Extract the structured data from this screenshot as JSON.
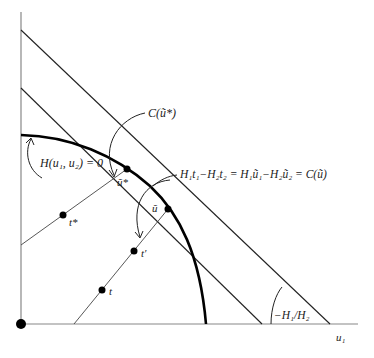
{
  "diagram": {
    "type": "economics-frontier",
    "axes": {
      "x_label": "u₁",
      "origin_marker": "dot"
    },
    "curves": [
      {
        "id": "frontier",
        "label": "H(u₁, u₂) = 0",
        "style": "thick"
      }
    ],
    "lines": [
      {
        "id": "upper-tangent",
        "label": "C(ũ*)"
      },
      {
        "id": "middle-tangent",
        "label": "H₁t₁−H₂t₂ = H₁ũ₁−H₂ũ₂ = C(ũ)"
      },
      {
        "id": "ray-tstar",
        "label": ""
      },
      {
        "id": "ray-t",
        "label": ""
      }
    ],
    "points": [
      {
        "id": "u-tilde-star",
        "label": "ũ*"
      },
      {
        "id": "u-tilde",
        "label": "ũ"
      },
      {
        "id": "t-star",
        "label": "t*"
      },
      {
        "id": "t-prime",
        "label": "t′"
      },
      {
        "id": "t",
        "label": "t"
      }
    ],
    "angle_label": "−H₁/H₂"
  },
  "labels": {
    "c_ustar": "C(ũ*)",
    "h_curve": "H(u₁, u₂) = 0",
    "equation": "H₁t₁−H₂t₂ = H₁ũ₁−H₂ũ₂ = C(ũ)",
    "u_star": "ũ*",
    "u_tilde": "ũ",
    "t_star": "t*",
    "t_prime": "t′",
    "t": "t",
    "slope": "−H₁/H₂",
    "x_axis": "u₁"
  }
}
